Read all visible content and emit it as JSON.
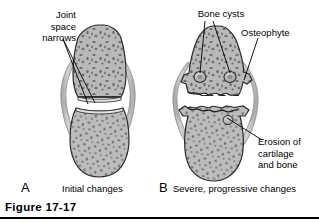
{
  "figure": {
    "caption": "Figure 17-17",
    "rule_color": "#000000",
    "background": "#ffffff"
  },
  "panels": [
    {
      "letter": "A",
      "caption": "Initial changes",
      "annotations": [
        {
          "name": "joint-space-narrows",
          "text": "Joint\nspace\nnarrows",
          "align": "right"
        }
      ]
    },
    {
      "letter": "B",
      "caption": "Severe, progressive changes",
      "annotations": [
        {
          "name": "bone-cysts",
          "text": "Bone cysts",
          "align": "center"
        },
        {
          "name": "osteophyte",
          "text": "Osteophyte",
          "align": "left"
        },
        {
          "name": "erosion-of-cartilage-and-bone",
          "text": "Erosion of\ncartilage\nand bone",
          "align": "left"
        }
      ]
    }
  ],
  "colors": {
    "bone_fill": "#b9b9b9",
    "bone_fill_light": "#cdcdcd",
    "bone_outline": "#2b2b2b",
    "trabecula": "#6a6a6a",
    "capsule_fill": "#c6c6c6",
    "capsule_outline": "#8a8a8a",
    "cartilage": "#e4e4e4",
    "joint_space": "#ffffff",
    "leader_line": "#000000",
    "text": "#000000"
  }
}
